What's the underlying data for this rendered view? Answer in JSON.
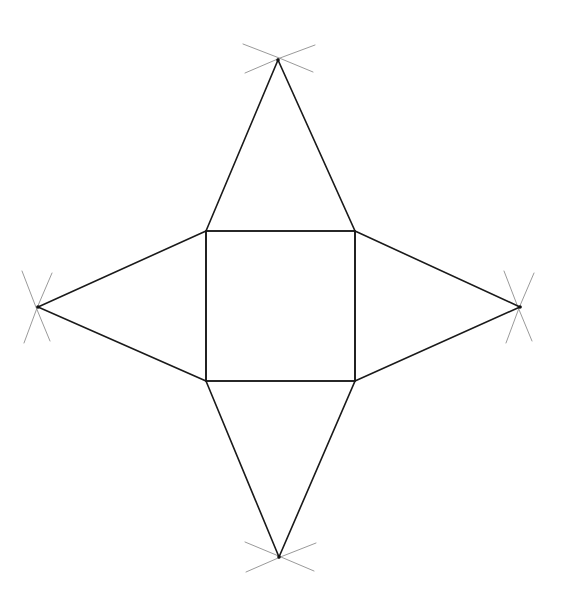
{
  "canvas": {
    "width": 567,
    "height": 601,
    "background_color": "#ffffff",
    "title": "Square with four isosceles triangles construction"
  },
  "style": {
    "edge_color": "#1a1a1a",
    "edge_width": 1.6,
    "arc_color": "#9a9a9a",
    "arc_width": 1.0,
    "vertex_dot_color": "#111111",
    "vertex_dot_radius": 1.8
  },
  "chart_data": {
    "type": "diagram",
    "xlabel": "",
    "ylabel": "",
    "xlim": [
      0,
      567
    ],
    "ylim": [
      0,
      601
    ],
    "grid": false,
    "legend": "none",
    "points": {
      "square_top_left": [
        206,
        231
      ],
      "square_top_right": [
        355,
        231
      ],
      "square_bottom_right": [
        355,
        381
      ],
      "square_bottom_left": [
        206,
        381
      ],
      "apex_top": [
        278,
        60
      ],
      "apex_right": [
        520,
        307
      ],
      "apex_bottom": [
        279,
        557
      ],
      "apex_left": [
        38,
        307
      ]
    },
    "square": {
      "left": 206,
      "top": 231,
      "right": 355,
      "bottom": 381,
      "width": 149,
      "height": 150
    },
    "shapes": [
      {
        "name": "central-square",
        "kind": "polygon",
        "vertices": [
          [
            206,
            231
          ],
          [
            355,
            231
          ],
          [
            355,
            381
          ],
          [
            206,
            381
          ]
        ]
      },
      {
        "name": "top-triangle",
        "kind": "polygon",
        "vertices": [
          [
            206,
            231
          ],
          [
            278,
            60
          ],
          [
            355,
            231
          ]
        ]
      },
      {
        "name": "right-triangle",
        "kind": "polygon",
        "vertices": [
          [
            355,
            231
          ],
          [
            520,
            307
          ],
          [
            355,
            381
          ]
        ]
      },
      {
        "name": "bottom-triangle",
        "kind": "polygon",
        "vertices": [
          [
            206,
            381
          ],
          [
            279,
            557
          ],
          [
            355,
            381
          ]
        ]
      },
      {
        "name": "left-triangle",
        "kind": "polygon",
        "vertices": [
          [
            206,
            231
          ],
          [
            38,
            307
          ],
          [
            206,
            381
          ]
        ]
      }
    ],
    "construction_arcs": [
      {
        "name": "arc-top-a",
        "at_vertex": "apex_top",
        "path": "M 243 44 Q 278 57 313 72"
      },
      {
        "name": "arc-top-b",
        "at_vertex": "apex_top",
        "path": "M 315 45 Q 280 57 245 73"
      },
      {
        "name": "arc-right-a",
        "at_vertex": "apex_right",
        "path": "M 504 271 Q 517 306 532 341"
      },
      {
        "name": "arc-right-b",
        "at_vertex": "apex_right",
        "path": "M 506 343 Q 518 308 534 273"
      },
      {
        "name": "arc-bottom-a",
        "at_vertex": "apex_bottom",
        "path": "M 245 542 Q 279 556 314 571"
      },
      {
        "name": "arc-bottom-b",
        "at_vertex": "apex_bottom",
        "path": "M 316 543 Q 281 556 246 572"
      },
      {
        "name": "arc-left-a",
        "at_vertex": "apex_left",
        "path": "M 22 271 Q 35 306 50 341"
      },
      {
        "name": "arc-left-b",
        "at_vertex": "apex_left",
        "path": "M 24 343 Q 36 308 52 273"
      }
    ]
  }
}
